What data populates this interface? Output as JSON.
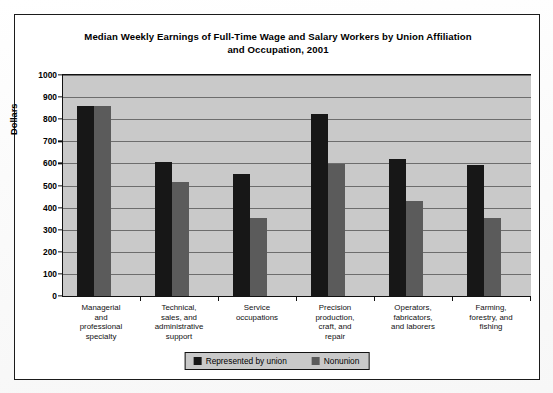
{
  "chart_data": {
    "type": "bar",
    "title": "Median Weekly Earnings of Full-Time Wage and Salary Workers by Union Affiliation and Occupation, 2001",
    "title_line1": "Median Weekly Earnings of Full-Time Wage and Salary Workers by Union Affiliation",
    "title_line2": "and Occupation, 2001",
    "xlabel": "",
    "ylabel": "Dollars",
    "ylim": [
      0,
      1000
    ],
    "ytick_step": 100,
    "yticks": [
      "1000",
      "900",
      "800",
      "700",
      "600",
      "500",
      "400",
      "300",
      "200",
      "100",
      "0"
    ],
    "grid": true,
    "legend_position": "bottom-center",
    "categories": [
      "Managerial and professional specialty",
      "Technical, sales, and administrative support",
      "Service occupations",
      "Precision production, craft, and repair",
      "Operators, fabricators, and laborers",
      "Farming, forestry, and fishing"
    ],
    "category_lines": [
      [
        "Managerial",
        "and",
        "professional",
        "specialty"
      ],
      [
        "Technical,",
        "sales, and",
        "administrative",
        "support"
      ],
      [
        "Service",
        "occupations"
      ],
      [
        "Precision",
        "production,",
        "craft, and",
        "repair"
      ],
      [
        "Operators,",
        "fabricators,",
        "and laborers"
      ],
      [
        "Farming,",
        "forestry, and",
        "fishing"
      ]
    ],
    "series": [
      {
        "name": "Represented by union",
        "color": "#171717",
        "values": [
          860,
          605,
          553,
          825,
          620,
          592
        ]
      },
      {
        "name": "Nonunion",
        "color": "#5b5b5b",
        "values": [
          862,
          515,
          355,
          598,
          432,
          355
        ]
      }
    ]
  },
  "colors": {
    "plot_background": "#c9c9c9",
    "gridline": "#6d6d6d",
    "axis": "#111111",
    "frame": "#1b1b1b",
    "page": "#fdfdfd"
  }
}
